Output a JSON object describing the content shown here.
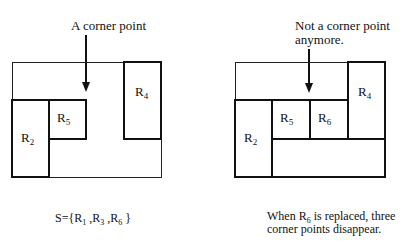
{
  "left_figure": {
    "annotation": "A corner point",
    "rectangles": [
      {
        "id": "R4",
        "base": "R",
        "sub": "4"
      },
      {
        "id": "R2",
        "base": "R",
        "sub": "2"
      },
      {
        "id": "R5",
        "base": "R",
        "sub": "5"
      }
    ],
    "caption": {
      "prefix": "S={R",
      "s1": "1",
      "mid1": " ,R",
      "s2": "3",
      "mid2": " ,R",
      "s3": "6",
      "suffix": " }"
    }
  },
  "right_figure": {
    "annotation_line1": "Not a corner point",
    "annotation_line2": "anymore.",
    "rectangles": [
      {
        "id": "R4",
        "base": "R",
        "sub": "4"
      },
      {
        "id": "R2",
        "base": "R",
        "sub": "2"
      },
      {
        "id": "R5",
        "base": "R",
        "sub": "5"
      },
      {
        "id": "R6",
        "base": "R",
        "sub": "6"
      }
    ],
    "caption": {
      "line1_prefix": "When R",
      "line1_sub": "6",
      "line1_suffix": " is replaced, three",
      "line2": "corner points disappear."
    }
  }
}
